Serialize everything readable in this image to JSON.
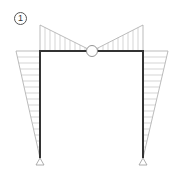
{
  "figure": {
    "label": "1"
  },
  "colors": {
    "frame": "#333333",
    "diagram_outline": "#aaaaaa",
    "hatch": "#bbbbbb",
    "support": "#999999",
    "hinge_fill": "#ffffff",
    "hinge_stroke": "#888888"
  },
  "geometry": {
    "frame": {
      "left_x": 40,
      "right_x": 143,
      "top_y": 51,
      "base_y": 158,
      "stroke_width": 2
    },
    "hinge": {
      "cx": 92,
      "cy": 51,
      "r": 5.5
    },
    "beam_moment": {
      "peak_y": 25
    },
    "column_moment": {
      "left_outer_x": 16,
      "right_outer_x": 168
    },
    "supports": [
      {
        "name": "left-pin-support",
        "x": 40,
        "y": 158
      },
      {
        "name": "right-pin-support",
        "x": 143,
        "y": 158
      }
    ]
  }
}
